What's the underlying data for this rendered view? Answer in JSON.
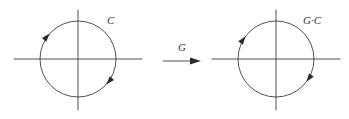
{
  "figure": {
    "type": "math-diagram",
    "background_color": "#ffffff",
    "stroke_color": "#3c3c3c",
    "text_color": "#333333",
    "panels": [
      {
        "id": "source-panel",
        "label": "C",
        "label_x": 107,
        "label_y": 21,
        "circle": {
          "cx": 78,
          "cy": 59,
          "r": 38
        },
        "x_axis": {
          "x1": 14,
          "y1": 59,
          "x2": 142,
          "y2": 59
        },
        "y_axis": {
          "x1": 78,
          "y1": 10,
          "x2": 78,
          "y2": 110
        },
        "orientation": "counterclockwise",
        "arrowheads": [
          {
            "name": "upper-left-orientation-arrow",
            "angle_deg": 138
          },
          {
            "name": "lower-right-orientation-arrow",
            "angle_deg": -42
          }
        ]
      },
      {
        "id": "target-panel",
        "label": "G·C",
        "label_x": 303,
        "label_y": 21,
        "circle": {
          "cx": 276,
          "cy": 59,
          "r": 38
        },
        "x_axis": {
          "x1": 212,
          "y1": 59,
          "x2": 340,
          "y2": 59
        },
        "y_axis": {
          "x1": 276,
          "y1": 10,
          "x2": 276,
          "y2": 110
        },
        "orientation": "counterclockwise",
        "arrowheads": [
          {
            "name": "upper-left-orientation-arrow",
            "angle_deg": 143
          },
          {
            "name": "lower-right-orientation-arrow",
            "angle_deg": -37
          }
        ]
      }
    ],
    "map_arrow": {
      "label": "G",
      "label_x": 178,
      "label_y": 48,
      "x1": 163,
      "y1": 61,
      "x2": 201,
      "y2": 61
    }
  }
}
